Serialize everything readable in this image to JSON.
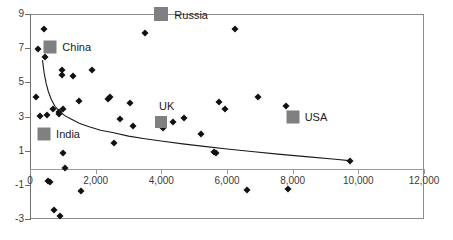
{
  "chart_data": {
    "type": "scatter",
    "title": "",
    "xlabel": "",
    "ylabel": "",
    "xlim": [
      0,
      12000
    ],
    "ylim": [
      -3,
      9
    ],
    "grid": false,
    "legend": "none",
    "xticks": [
      0,
      2000,
      4000,
      6000,
      8000,
      10000,
      12000
    ],
    "xtick_labels": [
      "0",
      "2,000",
      "4,000",
      "6,000",
      "8,000",
      "10,000",
      "12,000"
    ],
    "yticks": [
      -3,
      -1,
      1,
      3,
      5,
      7,
      9
    ],
    "ytick_labels": [
      "-3",
      "-1",
      "1",
      "3",
      "5",
      "7",
      "9"
    ],
    "series": [
      {
        "name": "countries",
        "marker": "diamond",
        "color": "#111111",
        "points": [
          [
            190,
            4.15
          ],
          [
            250,
            6.95
          ],
          [
            300,
            3.05
          ],
          [
            430,
            8.1
          ],
          [
            450,
            6.5
          ],
          [
            520,
            3.1
          ],
          [
            560,
            -0.8
          ],
          [
            610,
            -0.85
          ],
          [
            700,
            3.45
          ],
          [
            740,
            -2.45
          ],
          [
            870,
            3.15
          ],
          [
            880,
            3.25
          ],
          [
            900,
            -2.85
          ],
          [
            960,
            5.45
          ],
          [
            980,
            5.7
          ],
          [
            1000,
            0.85
          ],
          [
            1020,
            3.45
          ],
          [
            1060,
            0.0
          ],
          [
            1300,
            5.35
          ],
          [
            1500,
            3.9
          ],
          [
            1560,
            -1.35
          ],
          [
            1880,
            5.7
          ],
          [
            2380,
            4.05
          ],
          [
            2450,
            4.15
          ],
          [
            2550,
            1.45
          ],
          [
            2750,
            2.85
          ],
          [
            3050,
            3.8
          ],
          [
            3150,
            2.45
          ],
          [
            3500,
            7.9
          ],
          [
            4050,
            2.35
          ],
          [
            4350,
            2.7
          ],
          [
            4700,
            2.9
          ],
          [
            5200,
            1.95
          ],
          [
            5600,
            0.95
          ],
          [
            5650,
            0.85
          ],
          [
            5750,
            3.85
          ],
          [
            5950,
            3.45
          ],
          [
            6250,
            8.1
          ],
          [
            6600,
            -1.3
          ],
          [
            6950,
            4.15
          ],
          [
            7800,
            3.6
          ],
          [
            7850,
            -1.25
          ],
          [
            9750,
            0.4
          ]
        ]
      }
    ],
    "highlighted": [
      {
        "name": "Russia",
        "x": 4000,
        "y": 9.0,
        "label_dx": 13,
        "label_dy": 1,
        "size": 14,
        "color": "#808080"
      },
      {
        "name": "China",
        "x": 620,
        "y": 7.05,
        "label_dx": 12,
        "label_dy": 0,
        "size": 13,
        "color": "#808080"
      },
      {
        "name": "India",
        "x": 430,
        "y": 1.95,
        "label_dx": 12,
        "label_dy": 0,
        "size": 13,
        "color": "#808080"
      },
      {
        "name": "UK",
        "x": 3990,
        "y": 2.65,
        "label_dx": -2,
        "label_dy": -16,
        "size": 12,
        "color": "#808080"
      },
      {
        "name": "USA",
        "x": 8000,
        "y": 3.0,
        "label_dx": 12,
        "label_dy": 0,
        "size": 13,
        "color": "#808080"
      }
    ],
    "trend_curve": {
      "description": "decaying power-law fit",
      "color": "#1a1a1a",
      "points": [
        [
          380,
          6.3
        ],
        [
          430,
          5.55
        ],
        [
          490,
          4.95
        ],
        [
          560,
          4.45
        ],
        [
          650,
          4.0
        ],
        [
          760,
          3.6
        ],
        [
          900,
          3.3
        ],
        [
          1060,
          3.05
        ],
        [
          1250,
          2.85
        ],
        [
          1500,
          2.6
        ],
        [
          1800,
          2.4
        ],
        [
          2150,
          2.2
        ],
        [
          2550,
          2.05
        ],
        [
          3000,
          1.85
        ],
        [
          3500,
          1.7
        ],
        [
          4050,
          1.55
        ],
        [
          4650,
          1.4
        ],
        [
          5300,
          1.25
        ],
        [
          6000,
          1.1
        ],
        [
          6750,
          0.95
        ],
        [
          7550,
          0.8
        ],
        [
          8400,
          0.65
        ],
        [
          9300,
          0.5
        ],
        [
          9800,
          0.4
        ]
      ]
    }
  }
}
